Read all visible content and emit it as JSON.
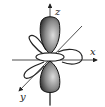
{
  "diagram": {
    "title": "",
    "type": "orbital",
    "axes": {
      "z_label": "z",
      "x_label": "x",
      "y_label": "y"
    },
    "colors": {
      "lobe_dark": "#3a3a3a",
      "lobe_light": "#d8d8d8",
      "line": "#222222",
      "background": "#ffffff"
    }
  }
}
